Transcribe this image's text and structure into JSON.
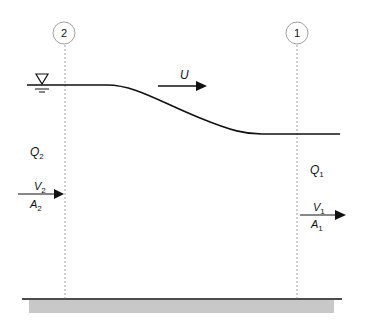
{
  "figure": {
    "type": "open-channel flow diagram",
    "sections": [
      {
        "id": "section-2",
        "label": "2",
        "x": 64
      },
      {
        "id": "section-1",
        "label": "1",
        "x": 297
      }
    ],
    "water_surface_symbol": "inverted-triangle",
    "labels": {
      "U": "U",
      "Q2": "Q",
      "Q2_sub": "2",
      "V2": "V",
      "V2_sub": "2",
      "A2": "A",
      "A2_sub": "2",
      "Q1": "Q",
      "Q1_sub": "1",
      "V1": "V",
      "V1_sub": "1",
      "A1": "A",
      "A1_sub": "1"
    },
    "colors": {
      "line": "#111111",
      "dashed": "#777777",
      "bed_fill": "#c8c8c8"
    }
  }
}
